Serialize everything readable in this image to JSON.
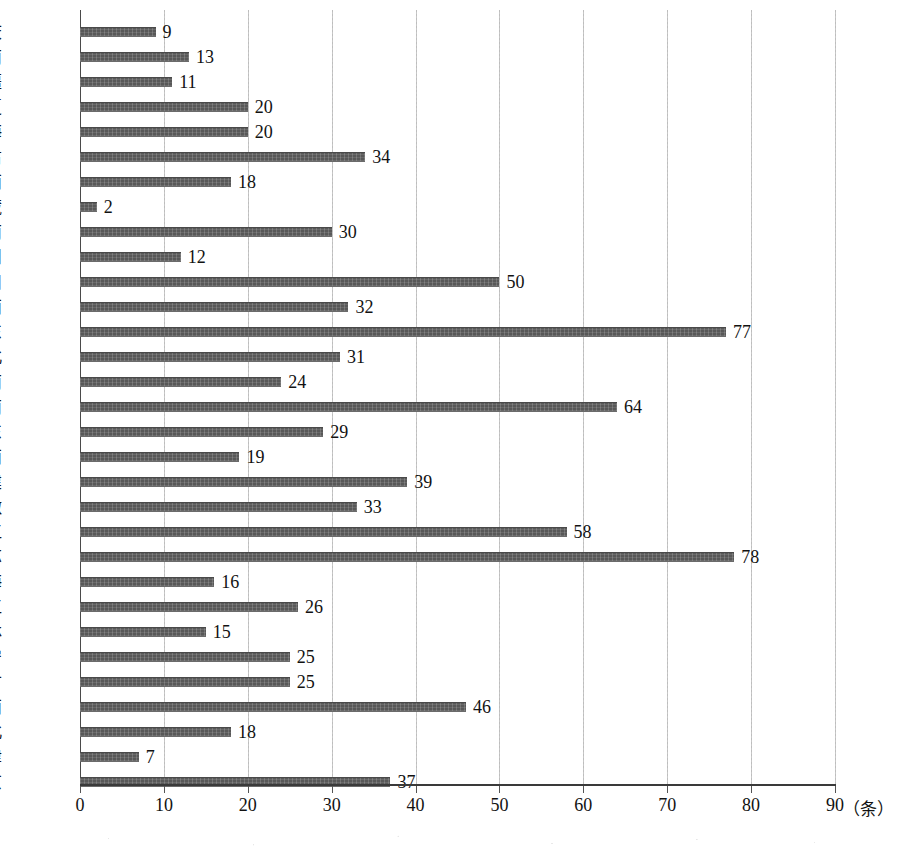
{
  "chart_data": {
    "type": "bar",
    "orientation": "horizontal",
    "title": "",
    "xlabel": "（条）",
    "ylabel": "",
    "xlim": [
      0,
      90
    ],
    "xticks": [
      0,
      10,
      20,
      30,
      40,
      50,
      60,
      70,
      80,
      90
    ],
    "xtick_labels": [
      "0",
      "10",
      "20",
      "30",
      "40",
      "50",
      "60",
      "70",
      "80",
      "90"
    ],
    "unit_label": "（条）",
    "grid": "vertical",
    "legend": "none",
    "bar_color": "#585858",
    "categories": [
      "重庆",
      "海南",
      "新疆",
      "宁夏",
      "青海",
      "甘肃",
      "陕西",
      "西藏",
      "云南",
      "贵州",
      "四川",
      "广西",
      "广东",
      "湖北",
      "湖南",
      "河南",
      "山东",
      "江西",
      "福建",
      "安徽",
      "浙江",
      "江苏",
      "上海",
      "黑龙江",
      "吉林",
      "辽宁",
      "内蒙古",
      "山西",
      "河北",
      "天津",
      "北京"
    ],
    "values": [
      9,
      13,
      11,
      20,
      20,
      34,
      18,
      2,
      30,
      12,
      50,
      32,
      77,
      31,
      24,
      64,
      29,
      19,
      39,
      33,
      58,
      78,
      16,
      26,
      15,
      25,
      25,
      46,
      18,
      7,
      37
    ],
    "data_labels": [
      "9",
      "13",
      "11",
      "20",
      "20",
      "34",
      "18",
      "2",
      "30",
      "12",
      "50",
      "32",
      "77",
      "31",
      "24",
      "64",
      "29",
      "19",
      "39",
      "33",
      "58",
      "78",
      "16",
      "26",
      "15",
      "25",
      "25",
      "46",
      "18",
      "7",
      "37"
    ]
  }
}
